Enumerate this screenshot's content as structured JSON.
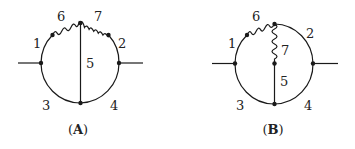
{
  "diagrams": [
    {
      "id": "A",
      "caption_open": "(",
      "caption_letter": "A",
      "caption_close": ")",
      "labels": {
        "l1": "1",
        "l2": "2",
        "l3": "3",
        "l4": "4",
        "l5": "5",
        "l6": "6",
        "l7": "7"
      }
    },
    {
      "id": "B",
      "caption_open": "(",
      "caption_letter": "B",
      "caption_close": ")",
      "labels": {
        "l1": "1",
        "l2": "2",
        "l3": "3",
        "l4": "4",
        "l5": "5",
        "l6": "6",
        "l7": "7"
      }
    }
  ],
  "colors": {
    "line": "#1a1a1a",
    "background": "#ffffff"
  }
}
